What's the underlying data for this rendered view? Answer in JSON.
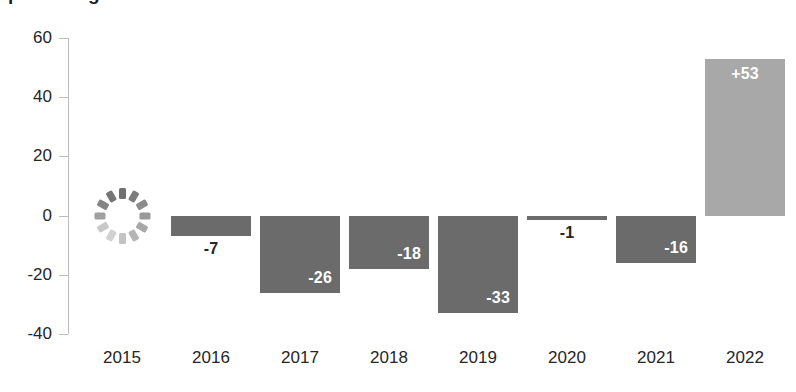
{
  "chart_data": {
    "type": "bar",
    "title": "percentage",
    "categories": [
      "2015",
      "2016",
      "2017",
      "2018",
      "2019",
      "2020",
      "2021",
      "2022"
    ],
    "values": [
      null,
      -7,
      -26,
      -18,
      -33,
      -1,
      -16,
      53
    ],
    "data_labels": [
      "",
      "-7",
      "-26",
      "-18",
      "-33",
      "-1",
      "-16",
      "+53"
    ],
    "xlabel": "",
    "ylabel": "",
    "ylim": [
      -40,
      60
    ],
    "yticks": [
      60,
      40,
      20,
      0,
      -20,
      -40
    ],
    "ytick_labels": [
      "60",
      "40",
      "20",
      "0",
      "-20",
      "-40"
    ],
    "grid": false,
    "legend": null,
    "series": [
      {
        "name": "annual change",
        "values": [
          null,
          -7,
          -26,
          -18,
          -33,
          -1,
          -16,
          53
        ]
      }
    ],
    "annotations": [
      {
        "category": "2015",
        "kind": "loading-spinner",
        "note": "data placeholder, value not rendered"
      }
    ],
    "colors": {
      "negative_bar": "#6b6b6b",
      "positive_bar": "#a8a8a8",
      "axis": "#bdbdbd",
      "tick_text": "#262626",
      "label_inside": "#ffffff",
      "label_outside": "#262626",
      "background": "#ffffff"
    }
  },
  "spinner": {
    "name": "loading-spinner",
    "segment_count": 12,
    "shades": [
      "#6f6f6f",
      "#7d7d7d",
      "#8b8b8b",
      "#999999",
      "#a7a7a7",
      "#b5b5b5",
      "#c3c3c3",
      "#d1d1d1",
      "#c9c9c9",
      "#a0a0a0",
      "#858585",
      "#757575"
    ]
  }
}
